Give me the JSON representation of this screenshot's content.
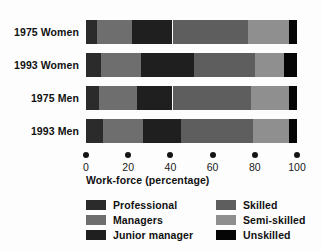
{
  "chart_data": {
    "type": "bar",
    "title": "",
    "subtitle": "",
    "orientation": "horizontal",
    "stacked": true,
    "normalized": true,
    "xlabel": "Work-force (percentage)",
    "ylabel": "",
    "xlim": [
      0,
      100
    ],
    "xticks": [
      0,
      20,
      40,
      60,
      80,
      100
    ],
    "xtick_labels": [
      "0",
      "20",
      "40",
      "60",
      "80",
      "100"
    ],
    "grid": false,
    "legend_position": "bottom",
    "categories": [
      "1975 Women",
      "1993 Women",
      "1975 Men",
      "1993 Men"
    ],
    "series": [
      {
        "name": "Professional",
        "color": "#2b2b2b",
        "values": [
          5,
          7,
          6,
          8
        ]
      },
      {
        "name": "Managers",
        "color": "#6e6e6e",
        "values": [
          17,
          19,
          18,
          19
        ]
      },
      {
        "name": "Junior manager",
        "color": "#1f1f1f",
        "values": [
          19,
          25,
          17,
          18
        ]
      },
      {
        "name": "Skilled",
        "color": "#5e5e5e",
        "values": [
          36,
          29,
          37,
          34
        ]
      },
      {
        "name": "Semi-skilled",
        "color": "#8f8f8f",
        "values": [
          19,
          14,
          18,
          17
        ]
      },
      {
        "name": "Unskilled",
        "color": "#050505",
        "values": [
          4,
          6,
          4,
          4
        ]
      }
    ],
    "bar_boundaries": {
      "1975 Women": [
        0,
        5,
        22,
        41,
        77,
        96,
        100
      ],
      "1993 Women": [
        0,
        7,
        26,
        51,
        80,
        94,
        100
      ],
      "1975 Men": [
        0,
        6,
        24,
        41,
        78,
        96,
        100
      ],
      "1993 Men": [
        0,
        8,
        27,
        45,
        79,
        96,
        100
      ]
    }
  },
  "axis": {
    "title": "Work-force (percentage)",
    "tick_labels": [
      "0",
      "20",
      "40",
      "60",
      "80",
      "100"
    ]
  },
  "rows": [
    {
      "label": "1975 Women"
    },
    {
      "label": "1993 Women"
    },
    {
      "label": "1975 Men"
    },
    {
      "label": "1993 Men"
    }
  ],
  "legend": {
    "left_column": [
      {
        "label": "Professional",
        "color": "#2b2b2b",
        "swatch_name": "swatch-professional"
      },
      {
        "label": "Managers",
        "color": "#6e6e6e",
        "swatch_name": "swatch-managers"
      },
      {
        "label": "Junior manager",
        "color": "#1f1f1f",
        "swatch_name": "swatch-junior-manager"
      }
    ],
    "right_column": [
      {
        "label": "Skilled",
        "color": "#5e5e5e",
        "swatch_name": "swatch-skilled"
      },
      {
        "label": "Semi-skilled",
        "color": "#8f8f8f",
        "swatch_name": "swatch-semi-skilled"
      },
      {
        "label": "Unskilled",
        "color": "#050505",
        "swatch_name": "swatch-unskilled"
      }
    ]
  },
  "layout": {
    "plot_left_px": 86,
    "plot_right_px": 297,
    "bar_tops_px": [
      20,
      53,
      86,
      119
    ],
    "bar_height_px": 24,
    "axis_dots_top_px": 152,
    "axis_title_left_px": 86,
    "axis_title_top_px": 174
  }
}
